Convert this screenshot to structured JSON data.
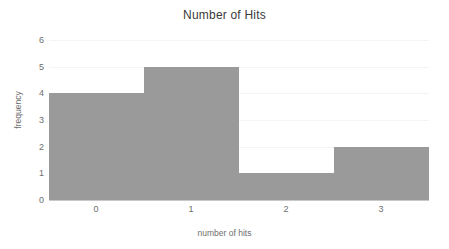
{
  "chart_data": {
    "type": "bar",
    "title": "Number of Hits",
    "xlabel": "number of hits",
    "ylabel": "frequency",
    "categories": [
      "0",
      "1",
      "2",
      "3"
    ],
    "values": [
      4,
      5,
      1,
      2
    ],
    "bin_edges": [
      -0.5,
      0.5,
      1.5,
      2.5,
      3.5
    ],
    "xtick_labels": [
      "0",
      "1",
      "2",
      "3"
    ],
    "ytick_labels": [
      "0",
      "1",
      "2",
      "3",
      "4",
      "5",
      "6"
    ],
    "yticks": [
      0,
      1,
      2,
      3,
      4,
      5,
      6
    ],
    "ylim": [
      0,
      6
    ],
    "xlim": [
      -0.5,
      3.5
    ],
    "grid": true,
    "legend": null,
    "bar_color": "#9a9a9a",
    "grid_color": "#f4f4f4",
    "axis_color": "#c8c8c8",
    "text_color": "#6e6e6e",
    "title_color": "#3a3a3a"
  }
}
